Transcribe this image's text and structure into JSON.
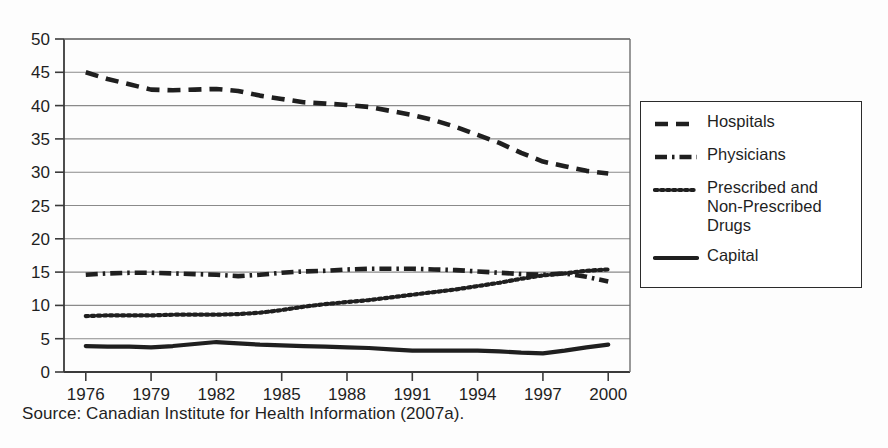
{
  "figure": {
    "caption": "Source: Canadian Institute for Health Information (2007a).",
    "background_color": "#fdfdfd",
    "ink_color": "#1f1f1f",
    "grid_color": "#8a8a8a"
  },
  "legend": {
    "position": "right",
    "items": [
      {
        "label": "Hospitals",
        "style": "dashed",
        "sample": "dashed-line-sample"
      },
      {
        "label": "Physicians",
        "style": "dash-dot",
        "sample": "dash-dot-line-sample"
      },
      {
        "label": "Prescribed and Non-Prescribed Drugs",
        "style": "dotted",
        "sample": "dotted-line-sample"
      },
      {
        "label": "Capital",
        "style": "solid",
        "sample": "solid-line-sample"
      }
    ]
  },
  "chart_data": {
    "type": "line",
    "title": "",
    "subtitle": "",
    "xlabel": "",
    "ylabel": "",
    "xlim": [
      1975,
      2001
    ],
    "ylim": [
      0,
      50
    ],
    "grid": true,
    "grid_axis": "y",
    "legend_position": "right",
    "x_tick_labels": [
      "1976",
      "1979",
      "1982",
      "1985",
      "1988",
      "1991",
      "1994",
      "1997",
      "2000"
    ],
    "x_tick_values": [
      1976,
      1979,
      1982,
      1985,
      1988,
      1991,
      1994,
      1997,
      2000
    ],
    "y_tick_labels": [
      "0",
      "5",
      "10",
      "15",
      "20",
      "25",
      "30",
      "35",
      "40",
      "45",
      "50"
    ],
    "y_tick_values": [
      0,
      5,
      10,
      15,
      20,
      25,
      30,
      35,
      40,
      45,
      50
    ],
    "x": [
      1976,
      1977,
      1978,
      1979,
      1980,
      1981,
      1982,
      1983,
      1984,
      1985,
      1986,
      1987,
      1988,
      1989,
      1990,
      1991,
      1992,
      1993,
      1994,
      1995,
      1996,
      1997,
      1998,
      1999,
      2000
    ],
    "series": [
      {
        "name": "Hospitals",
        "style": "dashed",
        "values": [
          45.0,
          44.0,
          43.2,
          42.4,
          42.3,
          42.4,
          42.5,
          42.2,
          41.5,
          41.0,
          40.5,
          40.3,
          40.1,
          39.8,
          39.2,
          38.6,
          37.8,
          36.8,
          35.6,
          34.4,
          32.9,
          31.6,
          30.9,
          30.2,
          29.8
        ]
      },
      {
        "name": "Physicians",
        "style": "dash-dot",
        "values": [
          14.6,
          14.8,
          14.9,
          14.9,
          14.8,
          14.7,
          14.6,
          14.4,
          14.6,
          14.9,
          15.1,
          15.2,
          15.4,
          15.5,
          15.5,
          15.5,
          15.4,
          15.3,
          15.1,
          14.9,
          14.7,
          14.6,
          14.8,
          14.3,
          13.6
        ]
      },
      {
        "name": "Prescribed and Non-Prescribed Drugs",
        "style": "dotted",
        "values": [
          8.4,
          8.5,
          8.5,
          8.5,
          8.6,
          8.6,
          8.6,
          8.7,
          8.9,
          9.3,
          9.8,
          10.2,
          10.5,
          10.8,
          11.2,
          11.6,
          12.0,
          12.4,
          12.9,
          13.4,
          14.0,
          14.5,
          14.8,
          15.2,
          15.4
        ]
      },
      {
        "name": "Capital",
        "style": "solid",
        "values": [
          3.9,
          3.8,
          3.8,
          3.7,
          3.9,
          4.2,
          4.5,
          4.3,
          4.1,
          4.0,
          3.9,
          3.8,
          3.7,
          3.6,
          3.4,
          3.2,
          3.2,
          3.2,
          3.2,
          3.1,
          2.9,
          2.8,
          3.2,
          3.7,
          4.1
        ]
      }
    ]
  }
}
